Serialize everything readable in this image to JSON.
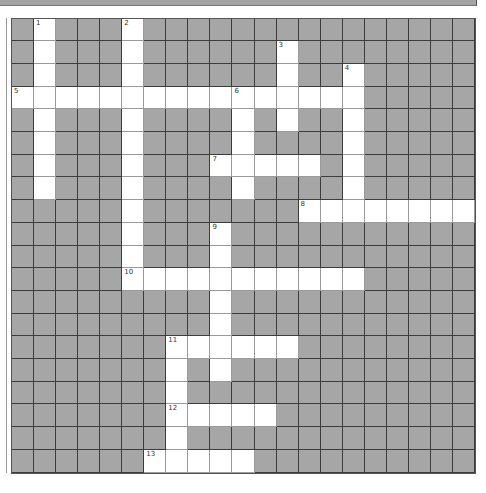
{
  "puzzle": {
    "cols": 21,
    "rows": 20,
    "colors": {
      "block": "#a6a6a6",
      "open": "#ffffff",
      "grid_line": "#3c3c3c"
    },
    "entries": [
      {
        "number": "1",
        "direction": "down",
        "row": 0,
        "col": 1,
        "length": 8
      },
      {
        "number": "2",
        "direction": "down",
        "row": 0,
        "col": 5,
        "length": 12
      },
      {
        "number": "3",
        "direction": "down",
        "row": 1,
        "col": 12,
        "length": 4
      },
      {
        "number": "4",
        "direction": "down",
        "row": 2,
        "col": 15,
        "length": 7
      },
      {
        "number": "5",
        "direction": "across",
        "row": 3,
        "col": 0,
        "length": 16
      },
      {
        "number": "6",
        "direction": "down",
        "row": 3,
        "col": 10,
        "length": 5
      },
      {
        "number": "7",
        "direction": "across",
        "row": 6,
        "col": 9,
        "length": 5
      },
      {
        "number": "8",
        "direction": "across",
        "row": 8,
        "col": 13,
        "length": 8
      },
      {
        "number": "9",
        "direction": "down",
        "row": 9,
        "col": 9,
        "length": 7
      },
      {
        "number": "10",
        "direction": "across",
        "row": 11,
        "col": 5,
        "length": 11
      },
      {
        "number": "11",
        "direction": "across",
        "row": 14,
        "col": 7,
        "length": 6
      },
      {
        "number": "11",
        "direction": "down",
        "row": 14,
        "col": 7,
        "length": 6
      },
      {
        "number": "12",
        "direction": "across",
        "row": 17,
        "col": 7,
        "length": 5
      },
      {
        "number": "13",
        "direction": "across",
        "row": 19,
        "col": 6,
        "length": 5
      }
    ]
  }
}
